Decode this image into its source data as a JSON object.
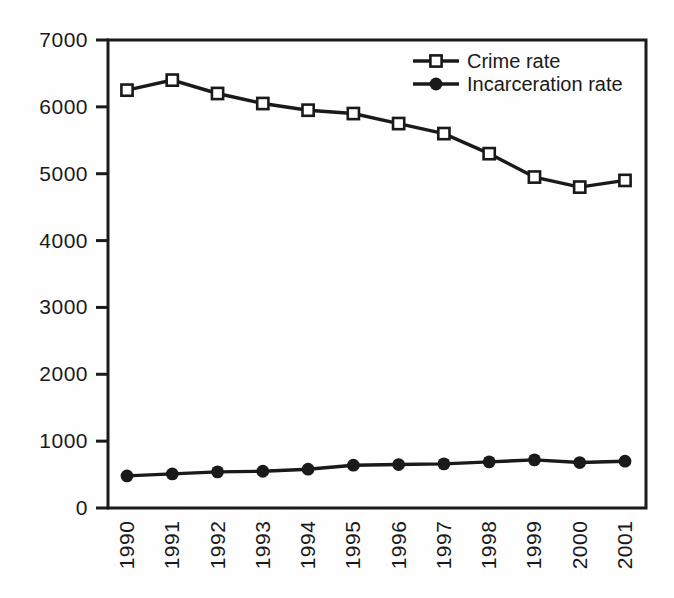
{
  "figure": {
    "background": "#fefefe",
    "ink_color": "#1a1a1a",
    "marker_fill_open": "#ffffff"
  },
  "chart_data": {
    "type": "line",
    "x_labels": [
      "1990",
      "1991",
      "1992",
      "1993",
      "1994",
      "1995",
      "1996",
      "1997",
      "1998",
      "1999",
      "2000",
      "2001"
    ],
    "series": [
      {
        "name": "Crime rate",
        "marker": "open-square",
        "values": [
          6250,
          6400,
          6200,
          6050,
          5950,
          5900,
          5750,
          5600,
          5300,
          4950,
          4800,
          4900
        ]
      },
      {
        "name": "Incarceration rate",
        "marker": "filled-circle",
        "values": [
          480,
          510,
          540,
          550,
          580,
          640,
          650,
          660,
          690,
          720,
          680,
          700
        ]
      }
    ],
    "ylim": [
      0,
      7000
    ],
    "yticks": [
      0,
      1000,
      2000,
      3000,
      4000,
      5000,
      6000,
      7000
    ],
    "ytick_labels": [
      "0",
      "1000",
      "2000",
      "3000",
      "4000",
      "5000",
      "6000",
      "7000"
    ],
    "legend_position": "top-right-inside",
    "grid": false
  }
}
